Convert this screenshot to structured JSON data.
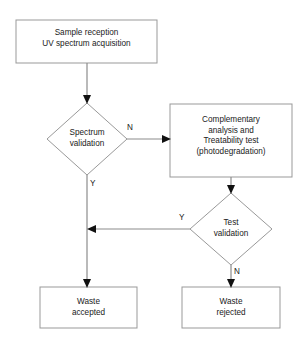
{
  "diagram": {
    "type": "flowchart",
    "title": "",
    "nodes": [
      {
        "id": "sample-reception",
        "shape": "process",
        "label": "Sample reception\nUV spectrum acquisition",
        "x": 16,
        "y": 20,
        "w": 141,
        "h": 43
      },
      {
        "id": "spectrum-validation",
        "shape": "decision",
        "label": "Spectrum\nvalidation",
        "cx": 87,
        "cy": 139,
        "rx": 40,
        "ry": 36
      },
      {
        "id": "complementary-analysis",
        "shape": "process",
        "label": "Complementary\nanalysis and\nTreatability test\n(photodegradation)",
        "x": 170,
        "y": 104,
        "w": 122,
        "h": 73
      },
      {
        "id": "test-validation",
        "shape": "decision",
        "label": "Test\nvalidation",
        "cx": 231,
        "cy": 229,
        "rx": 41,
        "ry": 36
      },
      {
        "id": "waste-accepted",
        "shape": "process",
        "label": "Waste\naccepted",
        "x": 40,
        "y": 287,
        "w": 97,
        "h": 41
      },
      {
        "id": "waste-rejected",
        "shape": "process",
        "label": "Waste\nrejected",
        "x": 182,
        "y": 287,
        "w": 98,
        "h": 41
      }
    ],
    "edges": [
      {
        "id": "e1",
        "from": "sample-reception",
        "to": "spectrum-validation",
        "label": ""
      },
      {
        "id": "e2",
        "from": "spectrum-validation",
        "to": "complementary-analysis",
        "label": "N",
        "label_x": 127,
        "label_y": 123
      },
      {
        "id": "e3",
        "from": "spectrum-validation",
        "to": "waste-accepted",
        "label": "Y",
        "label_x": 90,
        "label_y": 179
      },
      {
        "id": "e4",
        "from": "complementary-analysis",
        "to": "test-validation",
        "label": ""
      },
      {
        "id": "e5",
        "from": "test-validation",
        "to": "waste-accepted",
        "label": "Y",
        "label_x": 179,
        "label_y": 213
      },
      {
        "id": "e6",
        "from": "test-validation",
        "to": "waste-rejected",
        "label": "N",
        "label_x": 234,
        "label_y": 267
      }
    ],
    "colors": {
      "shape_stroke": "#999999",
      "connector": "#8c8c8c",
      "arrow_head": "#111111",
      "text": "#1a1a1a",
      "background": "#ffffff"
    },
    "caption_fragment": "a figure caption cropped at the bottom edge"
  }
}
